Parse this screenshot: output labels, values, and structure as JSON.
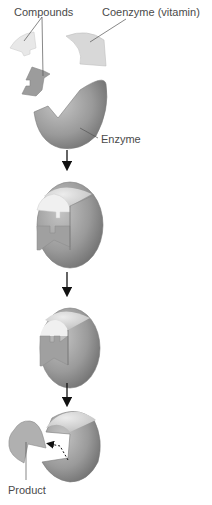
{
  "labels": {
    "compounds": "Compounds",
    "coenzyme": "Coenzyme (vitamin)",
    "enzyme": "Enzyme",
    "product": "Product"
  },
  "colors": {
    "enzyme_dark": "#8a8a8a",
    "enzyme_mid": "#a8a8a8",
    "enzyme_light": "#cfcfcf",
    "coenzyme": "#d6d6d6",
    "compound_light": "#e6e6e6",
    "compound_dark": "#9a9a9a",
    "arrow": "#111111",
    "text": "#4a4a4a"
  },
  "steps": [
    {
      "id": "separate",
      "description": "Enzyme, coenzyme and compounds separate"
    },
    {
      "id": "bound",
      "description": "Coenzyme and compounds bound to enzyme"
    },
    {
      "id": "reacting",
      "description": "Compounds joined within enzyme"
    },
    {
      "id": "release",
      "description": "Product released"
    }
  ]
}
